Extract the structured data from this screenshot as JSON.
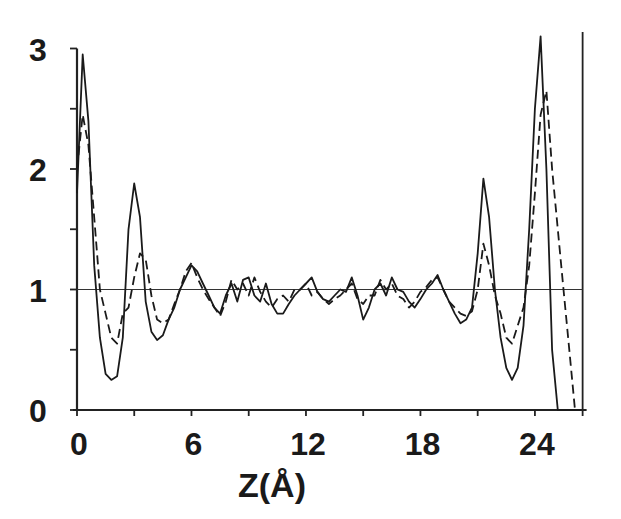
{
  "chart_data": {
    "type": "line",
    "title": "",
    "xlabel": "Z(Å)",
    "ylabel": "",
    "xlim": [
      0,
      26.5
    ],
    "ylim": [
      0,
      3
    ],
    "x_ticks": [
      0,
      6,
      12,
      18,
      24
    ],
    "x_minor_ticks": [
      3,
      9,
      15,
      21
    ],
    "y_ticks": [
      0,
      1,
      2,
      3
    ],
    "y_minor_ticks": [
      0.5,
      1.5,
      2.5
    ],
    "grid": false,
    "legend": null,
    "reference_line": {
      "y": 1,
      "style": "solid-thin"
    },
    "series": [
      {
        "name": "solid",
        "style": "solid",
        "x": [
          0.0,
          0.3,
          0.6,
          0.9,
          1.2,
          1.5,
          1.8,
          2.1,
          2.4,
          2.7,
          3.0,
          3.3,
          3.6,
          3.9,
          4.2,
          4.5,
          4.8,
          5.1,
          5.4,
          5.7,
          6.0,
          6.3,
          6.6,
          6.9,
          7.2,
          7.5,
          7.8,
          8.1,
          8.4,
          8.7,
          9.0,
          9.3,
          9.6,
          9.9,
          10.2,
          10.5,
          10.8,
          11.1,
          11.4,
          11.7,
          12.0,
          12.3,
          12.6,
          12.9,
          13.2,
          13.5,
          13.8,
          14.1,
          14.4,
          14.7,
          15.0,
          15.3,
          15.6,
          15.9,
          16.2,
          16.5,
          16.8,
          17.1,
          17.4,
          17.7,
          18.0,
          18.3,
          18.6,
          18.9,
          19.2,
          19.5,
          19.8,
          20.1,
          20.4,
          20.7,
          21.0,
          21.3,
          21.6,
          21.9,
          22.2,
          22.5,
          22.8,
          23.1,
          23.4,
          23.7,
          24.0,
          24.3,
          24.6,
          24.9,
          25.2,
          25.5,
          25.8,
          26.1,
          26.4
        ],
        "y": [
          1.8,
          2.95,
          2.4,
          1.2,
          0.6,
          0.3,
          0.25,
          0.28,
          0.6,
          1.5,
          1.88,
          1.6,
          0.9,
          0.65,
          0.58,
          0.62,
          0.75,
          0.85,
          1.0,
          1.1,
          1.2,
          1.15,
          1.05,
          0.95,
          0.85,
          0.8,
          0.95,
          1.05,
          0.9,
          1.08,
          1.1,
          0.95,
          0.9,
          1.05,
          0.88,
          0.8,
          0.8,
          0.88,
          0.95,
          1.0,
          1.05,
          1.1,
          0.98,
          0.92,
          0.9,
          0.95,
          1.0,
          0.98,
          1.1,
          0.95,
          0.75,
          0.85,
          1.0,
          1.05,
          0.95,
          1.1,
          1.0,
          0.98,
          0.9,
          0.85,
          0.92,
          1.0,
          1.05,
          1.12,
          1.0,
          0.9,
          0.8,
          0.72,
          0.75,
          0.85,
          1.3,
          1.92,
          1.6,
          1.0,
          0.6,
          0.35,
          0.25,
          0.35,
          0.7,
          1.5,
          2.5,
          3.1,
          2.0,
          0.5,
          0.0,
          0.0,
          0.0,
          0.0,
          0.0
        ]
      },
      {
        "name": "dashed",
        "style": "dashed",
        "x": [
          0.0,
          0.3,
          0.6,
          0.9,
          1.2,
          1.5,
          1.8,
          2.1,
          2.4,
          2.7,
          3.0,
          3.3,
          3.6,
          3.9,
          4.2,
          4.5,
          4.8,
          5.1,
          5.4,
          5.7,
          6.0,
          6.3,
          6.6,
          6.9,
          7.2,
          7.5,
          7.8,
          8.1,
          8.4,
          8.7,
          9.0,
          9.3,
          9.6,
          9.9,
          10.2,
          10.5,
          10.8,
          11.1,
          11.4,
          11.7,
          12.0,
          12.3,
          12.6,
          12.9,
          13.2,
          13.5,
          13.8,
          14.1,
          14.4,
          14.7,
          15.0,
          15.3,
          15.6,
          15.9,
          16.2,
          16.5,
          16.8,
          17.1,
          17.4,
          17.7,
          18.0,
          18.3,
          18.6,
          18.9,
          19.2,
          19.5,
          19.8,
          20.1,
          20.4,
          20.7,
          21.0,
          21.3,
          21.6,
          21.9,
          22.2,
          22.5,
          22.8,
          23.1,
          23.4,
          23.7,
          24.0,
          24.3,
          24.6,
          24.9,
          25.2,
          25.5,
          25.8,
          26.1,
          26.4
        ],
        "y": [
          2.0,
          2.45,
          2.2,
          1.6,
          1.0,
          0.8,
          0.6,
          0.55,
          0.8,
          0.85,
          1.1,
          1.3,
          1.25,
          0.95,
          0.75,
          0.72,
          0.75,
          0.88,
          1.0,
          1.15,
          1.22,
          1.1,
          1.0,
          0.92,
          0.85,
          0.78,
          0.9,
          1.08,
          1.0,
          1.05,
          0.95,
          1.1,
          0.98,
          0.9,
          0.85,
          0.92,
          0.95,
          0.9,
          1.0,
          1.0,
          1.05,
          0.95,
          0.98,
          0.92,
          0.88,
          0.92,
          0.95,
          1.0,
          1.05,
          0.92,
          0.88,
          0.95,
          0.95,
          1.08,
          1.0,
          1.05,
          0.95,
          0.92,
          0.85,
          0.9,
          0.98,
          1.02,
          1.08,
          1.1,
          1.0,
          0.9,
          0.85,
          0.8,
          0.78,
          0.82,
          1.0,
          1.38,
          1.2,
          0.95,
          0.8,
          0.6,
          0.55,
          0.7,
          0.85,
          1.2,
          1.8,
          2.45,
          2.65,
          2.0,
          1.5,
          1.0,
          0.5,
          0.0,
          0.0
        ]
      }
    ]
  },
  "axes": {
    "y_labels": [
      "0",
      "1",
      "2",
      "3"
    ],
    "x_labels": [
      "0",
      "6",
      "12",
      "18",
      "24"
    ],
    "x_title": "Z(Å)"
  }
}
